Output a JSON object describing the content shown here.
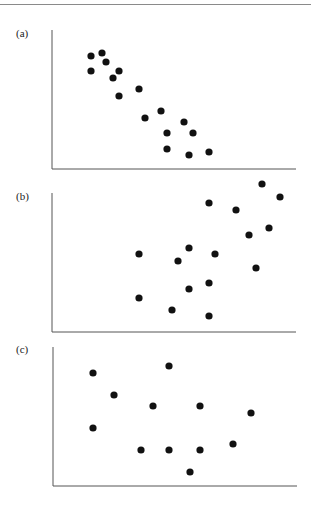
{
  "figure": {
    "top_rule_color": "#8a8a8a",
    "axis_color": "#555555",
    "point_color": "#111111"
  },
  "chart_data": [
    {
      "type": "scatter",
      "label": "(a)",
      "title": "",
      "xlabel": "",
      "ylabel": "",
      "grid": false,
      "legend": null,
      "axis_box_px": {
        "left": 52,
        "top": 30,
        "right": 296,
        "bottom": 169
      },
      "x": [
        0.16,
        0.205,
        0.221,
        0.16,
        0.25,
        0.275,
        0.275,
        0.357,
        0.381,
        0.447,
        0.471,
        0.541,
        0.578,
        0.471,
        0.561,
        0.643
      ],
      "y": [
        0.813,
        0.835,
        0.77,
        0.705,
        0.655,
        0.705,
        0.525,
        0.576,
        0.367,
        0.417,
        0.259,
        0.338,
        0.259,
        0.144,
        0.101,
        0.122
      ],
      "points_px": [
        [
          91,
          56
        ],
        [
          102,
          53
        ],
        [
          106,
          62
        ],
        [
          91,
          71
        ],
        [
          113,
          78
        ],
        [
          119,
          71
        ],
        [
          119,
          96
        ],
        [
          139,
          89
        ],
        [
          145,
          118
        ],
        [
          161,
          111
        ],
        [
          167,
          133
        ],
        [
          184,
          122
        ],
        [
          193,
          133
        ],
        [
          167,
          149
        ],
        [
          189,
          155
        ],
        [
          209,
          152
        ]
      ],
      "trend": "negative correlation"
    },
    {
      "type": "scatter",
      "label": "(b)",
      "title": "",
      "xlabel": "",
      "ylabel": "",
      "grid": false,
      "legend": null,
      "axis_box_px": {
        "left": 52,
        "top": 193,
        "right": 296,
        "bottom": 332
      },
      "x": [
        0.357,
        0.643,
        0.754,
        0.861,
        0.934,
        0.889,
        0.807,
        0.561,
        0.516,
        0.668,
        0.836,
        0.643,
        0.561,
        0.357,
        0.492,
        0.643
      ],
      "y": [
        0.561,
        0.928,
        0.878,
        1.065,
        0.971,
        0.748,
        0.698,
        0.604,
        0.511,
        0.561,
        0.46,
        0.353,
        0.309,
        0.245,
        0.158,
        0.115
      ],
      "points_px": [
        [
          139,
          254
        ],
        [
          209,
          203
        ],
        [
          236,
          210
        ],
        [
          262,
          184
        ],
        [
          280,
          197
        ],
        [
          269,
          228
        ],
        [
          249,
          235
        ],
        [
          189,
          248
        ],
        [
          178,
          261
        ],
        [
          215,
          254
        ],
        [
          256,
          268
        ],
        [
          209,
          283
        ],
        [
          189,
          289
        ],
        [
          139,
          298
        ],
        [
          172,
          310
        ],
        [
          209,
          316
        ]
      ],
      "trend": "positive correlation"
    },
    {
      "type": "scatter",
      "label": "(c)",
      "title": "",
      "xlabel": "",
      "ylabel": "",
      "grid": false,
      "legend": null,
      "axis_box_px": {
        "left": 53,
        "top": 347,
        "right": 297,
        "bottom": 486
      },
      "x": [
        0.164,
        0.475,
        0.25,
        0.41,
        0.602,
        0.811,
        0.164,
        0.361,
        0.475,
        0.602,
        0.738,
        0.561
      ],
      "y": [
        0.813,
        0.863,
        0.655,
        0.576,
        0.576,
        0.525,
        0.417,
        0.259,
        0.259,
        0.259,
        0.302,
        0.101
      ],
      "points_px": [
        [
          93,
          373
        ],
        [
          169,
          366
        ],
        [
          114,
          395
        ],
        [
          153,
          406
        ],
        [
          200,
          406
        ],
        [
          251,
          413
        ],
        [
          93,
          428
        ],
        [
          141,
          450
        ],
        [
          169,
          450
        ],
        [
          200,
          450
        ],
        [
          233,
          444
        ],
        [
          190,
          472
        ]
      ],
      "trend": "no correlation"
    }
  ]
}
